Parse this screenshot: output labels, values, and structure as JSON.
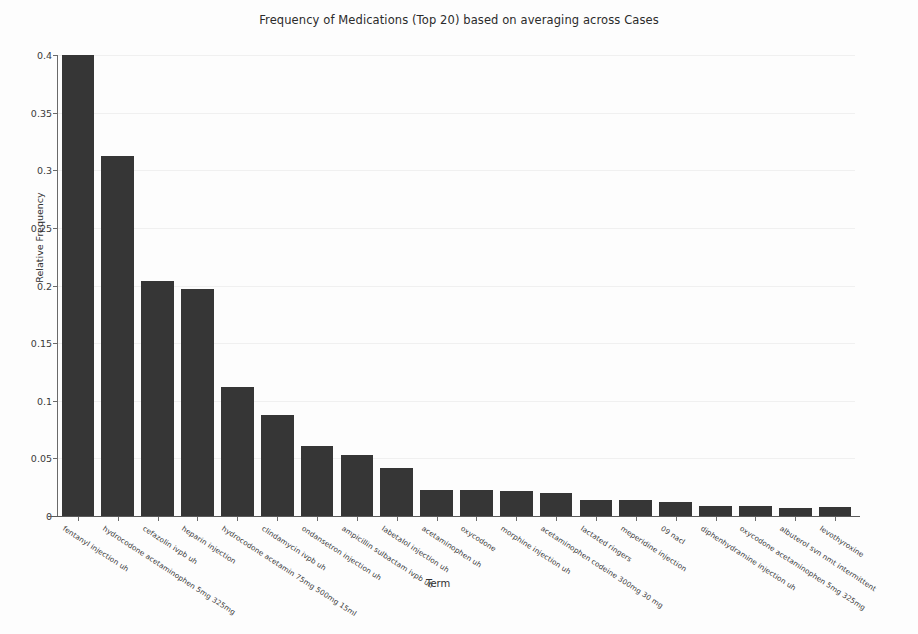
{
  "chart_data": {
    "type": "bar",
    "title": "Frequency of Medications (Top 20) based on averaging across Cases",
    "xlabel": "Term",
    "ylabel": "Relative Frequency",
    "ylim": [
      0,
      0.4
    ],
    "yticks": [
      0,
      0.05,
      0.1,
      0.15,
      0.2,
      0.25,
      0.3,
      0.35,
      0.4
    ],
    "ytick_labels": [
      "0",
      "0.05",
      "0.1",
      "0.15",
      "0.2",
      "0.25",
      "0.3",
      "0.35",
      "0.4"
    ],
    "grid": true,
    "legend": "none",
    "bar_color": "#363636",
    "background_color": "#fdfdfd",
    "categories": [
      "fentanyl injection uh",
      "hydrocodone acetaminophen 5mg 325mg",
      "cefazolin ivpb uh",
      "heparin injection",
      "hydrocodone acetamin 75mg 500mg 15ml",
      "clindamycin ivpb uh",
      "ondansetron injection uh",
      "ampicillin sulbactam ivpb uh",
      "labetalol injection uh",
      "acetaminophen uh",
      "oxycodone",
      "morphine injection uh",
      "acetaminophen codeine 300mg 30 mg",
      "lactated ringers",
      "meperidine injection",
      "09 nacl",
      "diphenhydramine injection uh",
      "oxycodone acetaminophen 5mg 325mg",
      "albuterol svn nmt intermittent",
      "levothyroxine"
    ],
    "values": [
      0.4,
      0.312,
      0.204,
      0.197,
      0.112,
      0.088,
      0.061,
      0.053,
      0.042,
      0.023,
      0.023,
      0.022,
      0.02,
      0.014,
      0.014,
      0.012,
      0.009,
      0.009,
      0.007,
      0.008
    ]
  }
}
